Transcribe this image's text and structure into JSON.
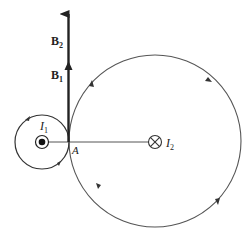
{
  "diagram": {
    "labels": {
      "B2": {
        "main": "B",
        "sub": "2"
      },
      "B1": {
        "main": "B",
        "sub": "1"
      },
      "I1": {
        "main": "I",
        "sub": "1"
      },
      "I2": {
        "main": "I",
        "sub": "2"
      },
      "A": "A"
    },
    "wire_1": {
      "symbol": "current-out-of-page",
      "label": "I1"
    },
    "wire_2": {
      "symbol": "current-into-page",
      "label": "I2"
    },
    "colors": {
      "line": "#555555",
      "arrow": "#222222",
      "background": "#ffffff"
    }
  }
}
